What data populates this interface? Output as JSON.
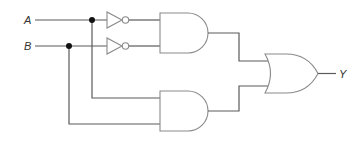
{
  "diagram": {
    "type": "logic-circuit",
    "inputs": [
      {
        "label": "A"
      },
      {
        "label": "B"
      }
    ],
    "output": {
      "label": "Y"
    },
    "gates": [
      {
        "id": "not-a",
        "type": "NOT",
        "input": "A"
      },
      {
        "id": "not-b",
        "type": "NOT",
        "input": "B"
      },
      {
        "id": "and-1",
        "type": "AND",
        "inputs": [
          "NOT A",
          "NOT B"
        ]
      },
      {
        "id": "and-2",
        "type": "AND",
        "inputs": [
          "A",
          "B"
        ]
      },
      {
        "id": "or-1",
        "type": "OR",
        "inputs": [
          "and-1",
          "and-2"
        ],
        "output": "Y"
      }
    ],
    "colors": {
      "wire": "#5a5a5a",
      "gate_outline": "#8a8a8a",
      "junction": "#111111",
      "label": "#333333"
    }
  }
}
